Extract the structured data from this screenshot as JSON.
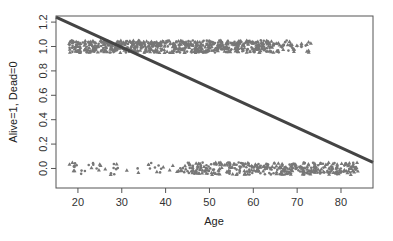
{
  "chart_data": {
    "type": "scatter",
    "title": "",
    "xlabel": "Age",
    "ylabel": "Alive=1, Dead=0",
    "xlim": [
      15,
      87.3
    ],
    "ylim": [
      -0.16,
      1.25
    ],
    "x_ticks": [
      20,
      30,
      40,
      50,
      60,
      70,
      80
    ],
    "y_ticks": [
      0.0,
      0.2,
      0.4,
      0.6,
      0.8,
      1.0,
      1.2
    ],
    "y_tick_labels": [
      "0.0",
      "0.2",
      "0.4",
      "0.6",
      "0.8",
      "1.0",
      "1.2"
    ],
    "grid": false,
    "legend": null,
    "series": [
      {
        "name": "Alive (jittered around 1.0)",
        "kind": "points",
        "y_center": 1.0,
        "jitter": 0.05,
        "age_range": [
          18,
          74
        ],
        "dense_range": [
          18,
          65
        ],
        "markers": [
          "circle",
          "triangle"
        ],
        "color": "#777777"
      },
      {
        "name": "Dead (jittered around 0.0)",
        "kind": "points",
        "y_center": 0.0,
        "jitter": 0.05,
        "age_range": [
          18,
          85
        ],
        "dense_range": [
          45,
          84
        ],
        "markers": [
          "circle",
          "triangle"
        ],
        "color": "#777777"
      },
      {
        "name": "Linear fit",
        "kind": "line",
        "x": [
          15,
          87.3
        ],
        "y": [
          1.24,
          0.05
        ],
        "color": "#444444",
        "width": 3
      }
    ]
  }
}
